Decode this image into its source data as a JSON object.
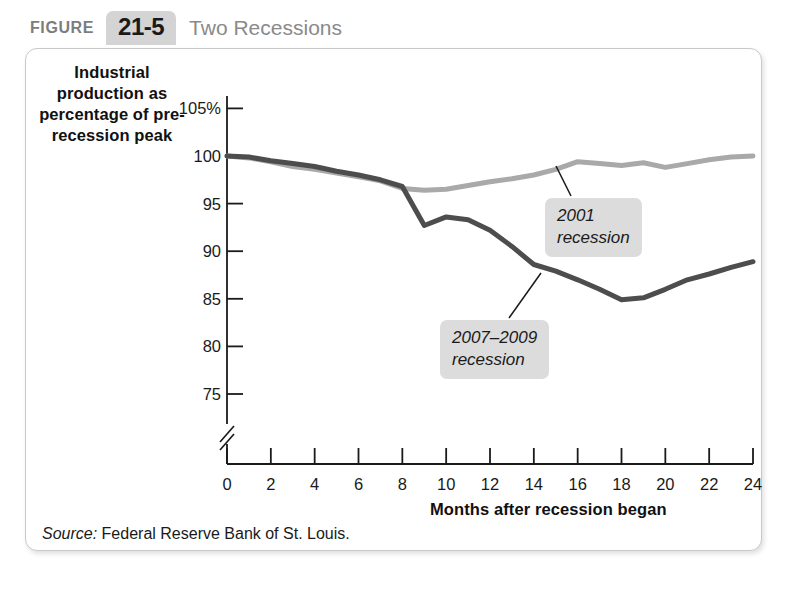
{
  "figure": {
    "label": "FIGURE",
    "number": "21-5",
    "title": "Two Recessions"
  },
  "source": {
    "label": "Source:",
    "text": " Federal Reserve Bank of St. Louis."
  },
  "colors": {
    "line_2001": "#a9a9a9",
    "line_2007": "#4d4d4d",
    "axis": "#1a1a1a",
    "panel_border": "#c9c9c9",
    "callout_bg": "#dcdcdc",
    "figure_number_bg": "#d4d4d4",
    "figure_title_text": "#8a8a8a"
  },
  "annotations": {
    "a2001": "2001\nrecession",
    "a2007": "2007–2009\nrecession"
  },
  "chart_data": {
    "type": "line",
    "title": "Two Recessions",
    "xlabel": "Months after recession began",
    "ylabel": "Industrial production as percentage of pre-recession peak",
    "xlim": [
      0,
      24
    ],
    "ylim": [
      73.5,
      105
    ],
    "xticks": [
      0,
      2,
      4,
      6,
      8,
      10,
      12,
      14,
      16,
      18,
      20,
      22,
      24
    ],
    "xticklabels": [
      "0",
      "2",
      "4",
      "6",
      "8",
      "10",
      "12",
      "14",
      "16",
      "18",
      "20",
      "22",
      "24"
    ],
    "yticks": [
      75,
      80,
      85,
      90,
      95,
      100,
      105
    ],
    "yticklabels": [
      "75",
      "80",
      "85",
      "90",
      "95",
      "100",
      "105%"
    ],
    "y_axis_break": true,
    "grid": false,
    "legend": "annotations-on-plot",
    "x": [
      0,
      1,
      2,
      3,
      4,
      5,
      6,
      7,
      8,
      9,
      10,
      11,
      12,
      13,
      14,
      15,
      16,
      17,
      18,
      19,
      20,
      21,
      22,
      23,
      24
    ],
    "series": [
      {
        "name": "2001 recession",
        "color": "#a9a9a9",
        "values": [
          100.0,
          99.8,
          99.4,
          98.9,
          98.6,
          98.2,
          97.8,
          97.4,
          96.6,
          96.4,
          96.5,
          96.9,
          97.3,
          97.6,
          98.0,
          98.6,
          99.4,
          99.2,
          99.0,
          99.3,
          98.8,
          99.2,
          99.6,
          99.9,
          100.0
        ]
      },
      {
        "name": "2007–2009 recession",
        "color": "#4d4d4d",
        "values": [
          100.0,
          99.9,
          99.5,
          99.2,
          98.9,
          98.4,
          98.0,
          97.5,
          96.8,
          92.7,
          93.6,
          93.3,
          92.2,
          90.5,
          88.6,
          87.9,
          87.0,
          86.0,
          84.9,
          85.1,
          86.0,
          87.0,
          87.6,
          88.3,
          88.9
        ]
      }
    ]
  }
}
